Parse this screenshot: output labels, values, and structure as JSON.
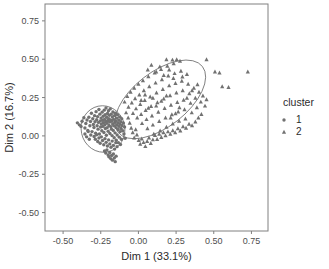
{
  "chart_data": {
    "type": "scatter",
    "title": "",
    "xlabel": "Dim 1 (33.1%)",
    "ylabel": "Dim 2 (16.7%)",
    "xlim": [
      -0.62,
      0.86
    ],
    "ylim": [
      -0.62,
      0.86
    ],
    "xticks": [
      -0.5,
      -0.25,
      0.0,
      0.25,
      0.5,
      0.75
    ],
    "xticklabels": [
      "-0.50",
      "-0.25",
      "0.00",
      "0.25",
      "0.50",
      "0.75"
    ],
    "yticks": [
      -0.5,
      -0.25,
      0.0,
      0.25,
      0.5,
      0.75
    ],
    "yticklabels": [
      "-0.50",
      "-0.25",
      "0.00",
      "0.25",
      "0.50",
      "0.75"
    ],
    "grid": false,
    "legend": {
      "title": "cluster",
      "position": "right",
      "entries": [
        {
          "label": "1",
          "marker": "circle",
          "color": "#717171"
        },
        {
          "label": "2",
          "marker": "triangle",
          "color": "#717171"
        }
      ]
    },
    "point_color": "#717171",
    "ellipse_color": "#6e6e6e",
    "panel_color": "#808080",
    "series": [
      {
        "name": "1",
        "marker": "circle",
        "color": "#717171",
        "ellipse": {
          "cx": -0.235,
          "cy": 0.045,
          "rx": 0.145,
          "ry": 0.152,
          "angle": -12
        },
        "points": [
          [
            -0.405,
            0.085
          ],
          [
            -0.392,
            0.072
          ],
          [
            -0.381,
            0.062
          ],
          [
            -0.374,
            0.096
          ],
          [
            -0.362,
            0.118
          ],
          [
            -0.355,
            0.052
          ],
          [
            -0.349,
            0.081
          ],
          [
            -0.341,
            0.104
          ],
          [
            -0.336,
            0.036
          ],
          [
            -0.329,
            0.122
          ],
          [
            -0.322,
            0.066
          ],
          [
            -0.318,
            0.094
          ],
          [
            -0.312,
            0.148
          ],
          [
            -0.308,
            0.028
          ],
          [
            -0.303,
            0.112
          ],
          [
            -0.299,
            0.074
          ],
          [
            -0.295,
            0.055
          ],
          [
            -0.291,
            0.132
          ],
          [
            -0.288,
            0.092
          ],
          [
            -0.284,
            0.018
          ],
          [
            -0.281,
            0.158
          ],
          [
            -0.277,
            0.105
          ],
          [
            -0.274,
            0.066
          ],
          [
            -0.271,
            0.126
          ],
          [
            -0.268,
            0.044
          ],
          [
            -0.265,
            0.088
          ],
          [
            -0.262,
            0.172
          ],
          [
            -0.259,
            0.012
          ],
          [
            -0.256,
            0.142
          ],
          [
            -0.253,
            0.098
          ],
          [
            -0.251,
            0.058
          ],
          [
            -0.248,
            0.116
          ],
          [
            -0.246,
            0.078
          ],
          [
            -0.243,
            0.034
          ],
          [
            -0.241,
            0.155
          ],
          [
            -0.238,
            0.102
          ],
          [
            -0.236,
            0.062
          ],
          [
            -0.234,
            0.128
          ],
          [
            -0.232,
            0.086
          ],
          [
            -0.229,
            0.022
          ],
          [
            -0.227,
            0.168
          ],
          [
            -0.225,
            0.108
          ],
          [
            -0.223,
            0.072
          ],
          [
            -0.221,
            0.138
          ],
          [
            -0.219,
            0.048
          ],
          [
            -0.217,
            0.094
          ],
          [
            -0.215,
            0.182
          ],
          [
            -0.213,
            0.004
          ],
          [
            -0.211,
            0.122
          ],
          [
            -0.209,
            0.082
          ],
          [
            -0.207,
            0.054
          ],
          [
            -0.205,
            0.146
          ],
          [
            -0.203,
            0.1
          ],
          [
            -0.201,
            0.03
          ],
          [
            -0.199,
            0.164
          ],
          [
            -0.197,
            0.112
          ],
          [
            -0.195,
            0.068
          ],
          [
            -0.193,
            0.134
          ],
          [
            -0.191,
            0.09
          ],
          [
            -0.189,
            0.016
          ],
          [
            -0.187,
            0.176
          ],
          [
            -0.185,
            0.104
          ],
          [
            -0.183,
            0.06
          ],
          [
            -0.181,
            0.142
          ],
          [
            -0.179,
            0.044
          ],
          [
            -0.177,
            0.096
          ],
          [
            -0.175,
            0.002
          ],
          [
            -0.173,
            0.124
          ],
          [
            -0.171,
            0.078
          ],
          [
            -0.169,
            0.156
          ],
          [
            -0.167,
            0.036
          ],
          [
            -0.165,
            0.108
          ],
          [
            -0.163,
            0.066
          ],
          [
            -0.161,
            -0.012
          ],
          [
            -0.159,
            0.132
          ],
          [
            -0.157,
            0.088
          ],
          [
            -0.155,
            0.02
          ],
          [
            -0.153,
            0.148
          ],
          [
            -0.151,
            0.098
          ],
          [
            -0.149,
            0.054
          ],
          [
            -0.147,
            -0.028
          ],
          [
            -0.145,
            0.116
          ],
          [
            -0.143,
            0.072
          ],
          [
            -0.141,
            0.006
          ],
          [
            -0.139,
            0.138
          ],
          [
            -0.137,
            0.086
          ],
          [
            -0.135,
            0.042
          ],
          [
            -0.133,
            -0.044
          ],
          [
            -0.131,
            0.104
          ],
          [
            -0.129,
            0.062
          ],
          [
            -0.127,
            -0.008
          ],
          [
            -0.125,
            0.124
          ],
          [
            -0.123,
            0.078
          ],
          [
            -0.121,
            0.028
          ],
          [
            -0.119,
            -0.056
          ],
          [
            -0.117,
            0.092
          ],
          [
            -0.115,
            0.048
          ],
          [
            -0.113,
            -0.022
          ],
          [
            -0.111,
            0.112
          ],
          [
            -0.109,
            0.068
          ],
          [
            -0.294,
            -0.004
          ],
          [
            -0.286,
            -0.022
          ],
          [
            -0.278,
            0.008
          ],
          [
            -0.27,
            -0.036
          ],
          [
            -0.262,
            -0.014
          ],
          [
            -0.254,
            -0.048
          ],
          [
            -0.246,
            -0.006
          ],
          [
            -0.238,
            -0.03
          ],
          [
            -0.23,
            -0.058
          ],
          [
            -0.222,
            -0.018
          ],
          [
            -0.214,
            -0.042
          ],
          [
            -0.206,
            -0.066
          ],
          [
            -0.198,
            -0.026
          ],
          [
            -0.19,
            -0.052
          ],
          [
            -0.182,
            -0.074
          ],
          [
            -0.174,
            -0.034
          ],
          [
            -0.166,
            -0.062
          ],
          [
            -0.158,
            -0.086
          ],
          [
            -0.15,
            -0.044
          ],
          [
            -0.142,
            -0.07
          ],
          [
            -0.225,
            -0.098
          ],
          [
            -0.217,
            -0.112
          ],
          [
            -0.209,
            -0.092
          ],
          [
            -0.201,
            -0.124
          ],
          [
            -0.196,
            -0.136
          ],
          [
            -0.19,
            -0.108
          ],
          [
            -0.184,
            -0.148
          ],
          [
            -0.178,
            -0.128
          ],
          [
            -0.172,
            -0.158
          ],
          [
            -0.166,
            -0.118
          ],
          [
            -0.16,
            -0.144
          ],
          [
            -0.154,
            -0.168
          ],
          [
            -0.148,
            -0.132
          ],
          [
            -0.355,
            0.012
          ],
          [
            -0.344,
            -0.006
          ],
          [
            -0.333,
            0.028
          ],
          [
            -0.326,
            -0.022
          ],
          [
            -0.316,
            0.006
          ],
          [
            -0.104,
            0.034
          ],
          [
            -0.1,
            0.084
          ],
          [
            -0.096,
            0.012
          ],
          [
            -0.092,
            0.058
          ],
          [
            -0.088,
            -0.016
          ]
        ]
      },
      {
        "name": "2",
        "marker": "triangle",
        "color": "#717171",
        "ellipse": {
          "cx": 0.145,
          "cy": 0.238,
          "rx": 0.355,
          "ry": 0.178,
          "angle": -38
        },
        "points": [
          [
            -0.092,
            0.222
          ],
          [
            -0.074,
            0.258
          ],
          [
            -0.066,
            0.188
          ],
          [
            -0.052,
            0.286
          ],
          [
            -0.044,
            0.216
          ],
          [
            -0.036,
            0.148
          ],
          [
            -0.028,
            0.312
          ],
          [
            -0.022,
            0.244
          ],
          [
            -0.016,
            0.178
          ],
          [
            -0.008,
            0.118
          ],
          [
            0.0,
            0.338
          ],
          [
            0.006,
            0.268
          ],
          [
            0.012,
            0.206
          ],
          [
            0.018,
            0.142
          ],
          [
            0.024,
            0.082
          ],
          [
            0.03,
            0.362
          ],
          [
            0.036,
            0.296
          ],
          [
            0.042,
            0.232
          ],
          [
            0.048,
            0.168
          ],
          [
            0.054,
            0.108
          ],
          [
            0.06,
            0.048
          ],
          [
            0.066,
            0.388
          ],
          [
            0.072,
            0.322
          ],
          [
            0.078,
            0.256
          ],
          [
            0.084,
            0.194
          ],
          [
            0.09,
            0.132
          ],
          [
            0.096,
            0.072
          ],
          [
            0.102,
            0.012
          ],
          [
            0.108,
            0.412
          ],
          [
            0.114,
            0.346
          ],
          [
            0.12,
            0.282
          ],
          [
            0.126,
            0.218
          ],
          [
            0.132,
            0.156
          ],
          [
            0.138,
            0.096
          ],
          [
            0.144,
            0.034
          ],
          [
            0.15,
            0.434
          ],
          [
            0.156,
            0.368
          ],
          [
            0.162,
            0.304
          ],
          [
            0.168,
            0.242
          ],
          [
            0.174,
            0.18
          ],
          [
            0.18,
            0.118
          ],
          [
            0.186,
            0.058
          ],
          [
            0.192,
            0.456
          ],
          [
            0.198,
            0.392
          ],
          [
            0.204,
            0.328
          ],
          [
            0.21,
            0.264
          ],
          [
            0.216,
            0.202
          ],
          [
            0.222,
            0.14
          ],
          [
            0.228,
            0.08
          ],
          [
            0.234,
            0.472
          ],
          [
            0.24,
            0.408
          ],
          [
            0.246,
            0.344
          ],
          [
            0.252,
            0.282
          ],
          [
            0.258,
            0.22
          ],
          [
            0.264,
            0.158
          ],
          [
            0.27,
            0.098
          ],
          [
            0.276,
            0.488
          ],
          [
            0.282,
            0.424
          ],
          [
            0.288,
            0.358
          ],
          [
            0.294,
            0.296
          ],
          [
            0.3,
            0.234
          ],
          [
            0.306,
            0.172
          ],
          [
            0.312,
            0.112
          ],
          [
            0.322,
            0.402
          ],
          [
            0.33,
            0.338
          ],
          [
            0.338,
            0.276
          ],
          [
            0.346,
            0.214
          ],
          [
            0.354,
            0.152
          ],
          [
            0.368,
            0.312
          ],
          [
            0.378,
            0.248
          ],
          [
            0.388,
            0.186
          ],
          [
            0.402,
            0.286
          ],
          [
            0.414,
            0.222
          ],
          [
            0.428,
            0.262
          ],
          [
            0.442,
            0.196
          ],
          [
            0.452,
            0.238
          ],
          [
            -0.082,
            0.152
          ],
          [
            -0.068,
            0.118
          ],
          [
            -0.058,
            0.084
          ],
          [
            -0.048,
            0.052
          ],
          [
            -0.038,
            0.022
          ],
          [
            -0.028,
            -0.012
          ],
          [
            -0.018,
            0.042
          ],
          [
            -0.01,
            0.008
          ],
          [
            0.002,
            -0.028
          ],
          [
            0.012,
            -0.052
          ],
          [
            0.022,
            -0.018
          ],
          [
            0.034,
            -0.042
          ],
          [
            0.046,
            -0.068
          ],
          [
            0.058,
            -0.034
          ],
          [
            0.07,
            -0.012
          ],
          [
            0.082,
            -0.048
          ],
          [
            0.096,
            -0.024
          ],
          [
            0.11,
            0.004
          ],
          [
            0.124,
            -0.022
          ],
          [
            0.138,
            0.012
          ],
          [
            0.152,
            -0.008
          ],
          [
            0.166,
            0.022
          ],
          [
            0.18,
            0.002
          ],
          [
            0.196,
            0.028
          ],
          [
            0.212,
            0.012
          ],
          [
            0.228,
            0.036
          ],
          [
            0.244,
            0.022
          ],
          [
            0.262,
            0.048
          ],
          [
            0.278,
            0.034
          ],
          [
            0.296,
            0.062
          ],
          [
            0.316,
            0.052
          ],
          [
            0.336,
            0.078
          ],
          [
            0.356,
            0.068
          ],
          [
            0.378,
            0.092
          ],
          [
            0.398,
            0.118
          ],
          [
            0.418,
            0.142
          ],
          [
            0.142,
            0.452
          ],
          [
            0.186,
            0.498
          ],
          [
            0.226,
            0.496
          ],
          [
            0.254,
            0.498
          ],
          [
            0.452,
            0.498
          ],
          [
            0.508,
            0.418
          ],
          [
            0.538,
            0.412
          ],
          [
            0.556,
            0.322
          ],
          [
            0.598,
            0.318
          ],
          [
            0.726,
            0.418
          ],
          [
            0.086,
            0.462
          ],
          [
            0.062,
            0.432
          ],
          [
            0.118,
            0.418
          ],
          [
            0.204,
            0.432
          ],
          [
            0.168,
            0.396
          ],
          [
            0.232,
            0.376
          ],
          [
            0.292,
            0.386
          ],
          [
            0.322,
            0.248
          ],
          [
            0.356,
            0.296
          ],
          [
            0.392,
            0.336
          ],
          [
            0.214,
            0.118
          ],
          [
            0.246,
            0.146
          ],
          [
            0.272,
            0.186
          ],
          [
            0.186,
            0.262
          ],
          [
            0.152,
            0.228
          ],
          [
            0.118,
            0.196
          ],
          [
            0.096,
            0.248
          ],
          [
            0.066,
            0.182
          ],
          [
            0.044,
            0.268
          ],
          [
            0.018,
            0.232
          ]
        ]
      }
    ]
  }
}
